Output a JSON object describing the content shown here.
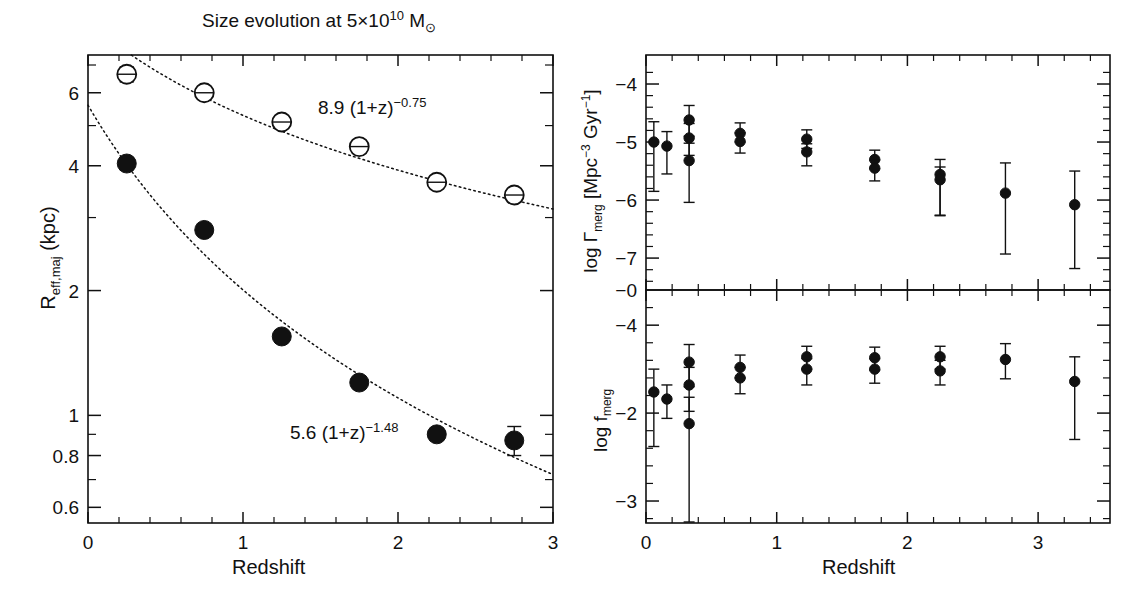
{
  "figure": {
    "panels": [
      "size-evolution",
      "merger-rate",
      "merger-fraction"
    ]
  },
  "left_panel": {
    "title": "Size evolution at 5×10",
    "title_exp": "10",
    "title_tail": " M",
    "title_sub": "⊙",
    "xlabel": "Redshift",
    "ylabel_main": "R",
    "ylabel_sub": "eff,maj",
    "ylabel_tail": " (kpc)",
    "xticks": [
      "0",
      "1",
      "2",
      "3"
    ],
    "yticks": [
      "0.6",
      "0.8",
      "1",
      "2",
      "4",
      "6"
    ],
    "annotation_sf": "8.9 (1+z)",
    "annotation_sf_exp": "−0.75",
    "annotation_q": "5.6 (1+z)",
    "annotation_q_exp": "−1.48"
  },
  "right_top_panel": {
    "ylabel": "log Γ",
    "ylabel_sub": "merg",
    "ylabel_units": " [Mpc",
    "ylabel_units_exp1": "−3",
    "ylabel_units_mid": " Gyr",
    "ylabel_units_exp2": "−1",
    "ylabel_units_end": "]",
    "yticks": [
      "−4",
      "−5",
      "−6",
      "−7",
      "−0"
    ]
  },
  "right_bottom_panel": {
    "ylabel": "log f",
    "ylabel_sub": "merg",
    "yticks": [
      "−4",
      "−2",
      "−3"
    ],
    "xlabel": "Redshift",
    "xticks": [
      "0",
      "1",
      "2",
      "3"
    ]
  },
  "chart_data": [
    {
      "type": "scatter",
      "id": "size-evolution",
      "title": "Size evolution at 5×10^10 M_sun",
      "xlabel": "Redshift",
      "ylabel": "R_eff,maj (kpc)",
      "xlim": [
        0,
        3
      ],
      "ylim": [
        0.55,
        7.4
      ],
      "yscale": "log",
      "xscale": "linear",
      "grid": false,
      "legend": "none",
      "series": [
        {
          "name": "star-forming (open circles)",
          "marker": "open-circle",
          "x": [
            0.25,
            0.75,
            1.25,
            1.75,
            2.25,
            2.75
          ],
          "y": [
            6.65,
            6.0,
            5.1,
            4.45,
            3.65,
            3.4
          ],
          "yerr": [
            0.28,
            0.13,
            0.13,
            0.13,
            0.1,
            0.1
          ],
          "fit_label": "8.9 (1+z)^-0.75",
          "fit_a": 8.9,
          "fit_b": -0.75
        },
        {
          "name": "quiescent (filled circles)",
          "marker": "filled-circle",
          "x": [
            0.25,
            0.75,
            1.25,
            1.75,
            2.25,
            2.75
          ],
          "y": [
            4.05,
            2.8,
            1.55,
            1.2,
            0.9,
            0.87
          ],
          "yerr": [
            0.14,
            0.0,
            0.0,
            0.0,
            0.03,
            0.07
          ],
          "fit_label": "5.6 (1+z)^-1.48",
          "fit_a": 5.6,
          "fit_b": -1.48
        }
      ],
      "annotations": [
        "8.9 (1+z)^-0.75",
        "5.6 (1+z)^-1.48"
      ]
    },
    {
      "type": "scatter",
      "id": "merger-rate",
      "xlabel": "Redshift",
      "ylabel": "log Γ_merg [Mpc^-3 Gyr^-1]",
      "xlim": [
        0,
        3.55
      ],
      "ylim": [
        -7.55,
        -3.5
      ],
      "grid": false,
      "legend": "none",
      "points": [
        {
          "x": 0.06,
          "y": -5.0,
          "err_lo": 0.85,
          "err_hi": 0.35
        },
        {
          "x": 0.16,
          "y": -5.07,
          "err_lo": 0.48,
          "err_hi": 0.25
        },
        {
          "x": 0.33,
          "y": -4.62,
          "err_lo": 0.28,
          "err_hi": 0.25
        },
        {
          "x": 0.33,
          "y": -4.93,
          "err_lo": 0.3,
          "err_hi": 0.25
        },
        {
          "x": 0.33,
          "y": -5.32,
          "err_lo": 0.72,
          "err_hi": 0.3
        },
        {
          "x": 0.72,
          "y": -4.85,
          "err_lo": 0.15,
          "err_hi": 0.18
        },
        {
          "x": 0.72,
          "y": -4.99,
          "err_lo": 0.2,
          "err_hi": 0.15
        },
        {
          "x": 1.23,
          "y": -4.95,
          "err_lo": 0.16,
          "err_hi": 0.16
        },
        {
          "x": 1.23,
          "y": -5.17,
          "err_lo": 0.24,
          "err_hi": 0.14
        },
        {
          "x": 1.75,
          "y": -5.3,
          "err_lo": 0.16,
          "err_hi": 0.16
        },
        {
          "x": 1.75,
          "y": -5.45,
          "err_lo": 0.22,
          "err_hi": 0.14
        },
        {
          "x": 2.25,
          "y": -5.56,
          "err_lo": 0.7,
          "err_hi": 0.26
        },
        {
          "x": 2.25,
          "y": -5.65,
          "err_lo": 0.62,
          "err_hi": 0.22
        },
        {
          "x": 2.75,
          "y": -5.88,
          "err_lo": 1.05,
          "err_hi": 0.52
        },
        {
          "x": 3.28,
          "y": -6.08,
          "err_lo": 1.1,
          "err_hi": 0.58
        }
      ]
    },
    {
      "type": "scatter",
      "id": "merger-fraction",
      "xlabel": "Redshift",
      "ylabel": "log f_merg",
      "xlim": [
        0,
        3.55
      ],
      "ylim": [
        -3.25,
        -0.6
      ],
      "grid": false,
      "legend": "none",
      "points": [
        {
          "x": 0.06,
          "y": -1.76,
          "err_lo": 0.62,
          "err_hi": 0.26
        },
        {
          "x": 0.16,
          "y": -1.84,
          "err_lo": 0.22,
          "err_hi": 0.16
        },
        {
          "x": 0.33,
          "y": -1.42,
          "err_lo": 0.28,
          "err_hi": 0.2
        },
        {
          "x": 0.33,
          "y": -1.68,
          "err_lo": 0.3,
          "err_hi": 0.2
        },
        {
          "x": 0.33,
          "y": -2.12,
          "err_lo": 1.15,
          "err_hi": 0.3
        },
        {
          "x": 0.72,
          "y": -1.48,
          "err_lo": 0.12,
          "err_hi": 0.14
        },
        {
          "x": 0.72,
          "y": -1.6,
          "err_lo": 0.18,
          "err_hi": 0.12
        },
        {
          "x": 1.23,
          "y": -1.36,
          "err_lo": 0.14,
          "err_hi": 0.12
        },
        {
          "x": 1.23,
          "y": -1.5,
          "err_lo": 0.18,
          "err_hi": 0.12
        },
        {
          "x": 1.75,
          "y": -1.37,
          "err_lo": 0.14,
          "err_hi": 0.12
        },
        {
          "x": 1.75,
          "y": -1.5,
          "err_lo": 0.16,
          "err_hi": 0.12
        },
        {
          "x": 2.25,
          "y": -1.36,
          "err_lo": 0.14,
          "err_hi": 0.12
        },
        {
          "x": 2.25,
          "y": -1.52,
          "err_lo": 0.16,
          "err_hi": 0.12
        },
        {
          "x": 2.75,
          "y": -1.39,
          "err_lo": 0.22,
          "err_hi": 0.18
        },
        {
          "x": 3.28,
          "y": -1.64,
          "err_lo": 0.66,
          "err_hi": 0.28
        }
      ]
    }
  ]
}
